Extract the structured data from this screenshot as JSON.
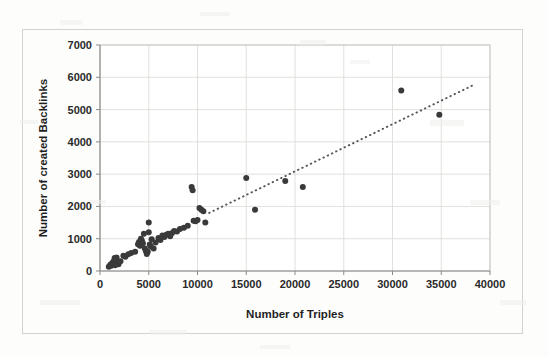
{
  "chart_data": {
    "type": "scatter",
    "title": "",
    "xlabel": "Number of Triples",
    "ylabel": "Number of created Backlinks",
    "xlim": [
      0,
      40000
    ],
    "ylim": [
      0,
      7000
    ],
    "xticks": [
      0,
      5000,
      10000,
      15000,
      20000,
      25000,
      30000,
      35000,
      40000
    ],
    "yticks": [
      0,
      1000,
      2000,
      3000,
      4000,
      5000,
      6000,
      7000
    ],
    "xtick_labels": [
      "0",
      "5000",
      "10000",
      "15000",
      "20000",
      "25000",
      "30000",
      "35000",
      "40000"
    ],
    "ytick_labels": [
      "0",
      "1000",
      "2000",
      "3000",
      "4000",
      "5000",
      "6000",
      "7000"
    ],
    "grid": true,
    "legend": false,
    "marker_color": "#3a3a3a",
    "marker_size": 6,
    "series": [
      {
        "name": "Datasets",
        "points": [
          [
            900,
            130
          ],
          [
            1050,
            190
          ],
          [
            1150,
            160
          ],
          [
            1250,
            250
          ],
          [
            1300,
            200
          ],
          [
            1400,
            300
          ],
          [
            1450,
            230
          ],
          [
            1500,
            400
          ],
          [
            1550,
            180
          ],
          [
            1600,
            330
          ],
          [
            1700,
            420
          ],
          [
            1800,
            260
          ],
          [
            1900,
            210
          ],
          [
            2100,
            300
          ],
          [
            2400,
            470
          ],
          [
            2600,
            440
          ],
          [
            2900,
            520
          ],
          [
            3200,
            560
          ],
          [
            3600,
            600
          ],
          [
            3900,
            830
          ],
          [
            4000,
            900
          ],
          [
            4100,
            780
          ],
          [
            4200,
            1000
          ],
          [
            4300,
            940
          ],
          [
            4400,
            860
          ],
          [
            4500,
            1150
          ],
          [
            4600,
            700
          ],
          [
            4700,
            620
          ],
          [
            4800,
            530
          ],
          [
            4900,
            600
          ],
          [
            5000,
            1500
          ],
          [
            5000,
            1200
          ],
          [
            5100,
            820
          ],
          [
            5200,
            760
          ],
          [
            5300,
            980
          ],
          [
            5500,
            700
          ],
          [
            5700,
            880
          ],
          [
            6000,
            1020
          ],
          [
            6200,
            960
          ],
          [
            6400,
            1100
          ],
          [
            6600,
            1050
          ],
          [
            6800,
            1120
          ],
          [
            7000,
            1150
          ],
          [
            7200,
            1080
          ],
          [
            7400,
            1180
          ],
          [
            7600,
            1240
          ],
          [
            7900,
            1220
          ],
          [
            8200,
            1300
          ],
          [
            8600,
            1340
          ],
          [
            9000,
            1400
          ],
          [
            9400,
            2600
          ],
          [
            9500,
            2500
          ],
          [
            9600,
            1560
          ],
          [
            9800,
            1540
          ],
          [
            10000,
            1580
          ],
          [
            10200,
            1950
          ],
          [
            10400,
            1900
          ],
          [
            10600,
            1850
          ],
          [
            10800,
            1500
          ],
          [
            15000,
            2880
          ],
          [
            15900,
            1900
          ],
          [
            19000,
            2790
          ],
          [
            20800,
            2600
          ],
          [
            30900,
            5590
          ],
          [
            34800,
            4840
          ]
        ]
      }
    ],
    "trendline": {
      "type": "dotted",
      "color": "#555555",
      "x_start": 11200,
      "y_start": 1800,
      "x_end": 38300,
      "y_end": 5760
    }
  },
  "axes": {
    "x_axis_name": "x-axis",
    "y_axis_name": "y-axis"
  }
}
